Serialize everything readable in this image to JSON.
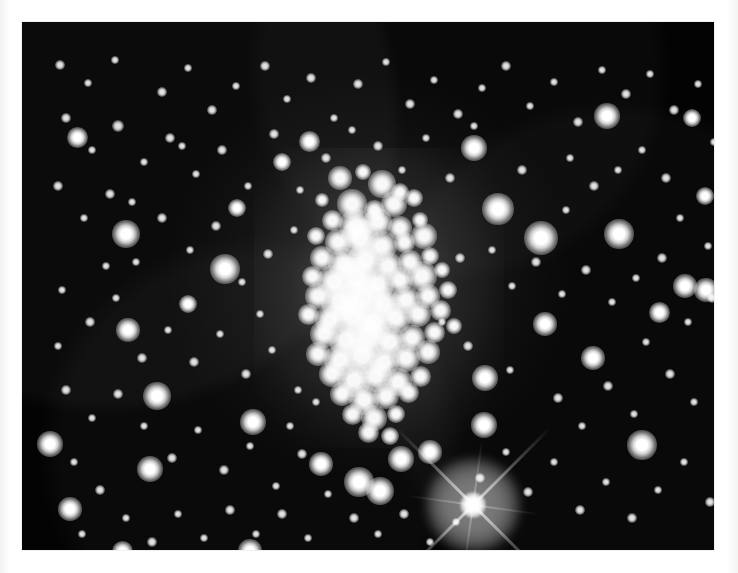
{
  "document": {
    "kind": "astronomical-photographic-plate",
    "subject": "dense star cluster field",
    "background_color": "#ffffff",
    "sky_color": "#030303",
    "star_color": "#ffffff"
  },
  "plate": {
    "x": 22,
    "y": 22,
    "width": 692,
    "height": 528,
    "label": "star-field-plate"
  },
  "cluster": {
    "name": "central star cluster core",
    "center_x": 357,
    "center_y": 276,
    "halo_width": 250,
    "halo_height": 300
  },
  "bright_spike_star": {
    "name": "bright foreground star with diffraction spikes",
    "x": 451,
    "y": 483,
    "core_size": 26,
    "spike_length": 118
  },
  "chart_data": {
    "type": "scatter",
    "title": "",
    "xlabel": "",
    "ylabel": "",
    "xlim": [
      0,
      692
    ],
    "ylim": [
      0,
      528
    ],
    "grid": false,
    "legend": null,
    "series": [
      {
        "name": "cluster-core-stars",
        "points": [
          [
            318,
            156,
            11
          ],
          [
            341,
            150,
            8
          ],
          [
            360,
            162,
            13
          ],
          [
            378,
            170,
            9
          ],
          [
            300,
            178,
            7
          ],
          [
            330,
            182,
            14
          ],
          [
            352,
            188,
            10
          ],
          [
            372,
            182,
            12
          ],
          [
            392,
            176,
            9
          ],
          [
            310,
            198,
            10
          ],
          [
            334,
            204,
            16
          ],
          [
            356,
            200,
            13
          ],
          [
            378,
            206,
            11
          ],
          [
            398,
            198,
            8
          ],
          [
            294,
            214,
            9
          ],
          [
            316,
            220,
            12
          ],
          [
            338,
            216,
            18
          ],
          [
            360,
            224,
            14
          ],
          [
            382,
            220,
            10
          ],
          [
            402,
            214,
            12
          ],
          [
            300,
            236,
            11
          ],
          [
            322,
            242,
            15
          ],
          [
            344,
            238,
            17
          ],
          [
            366,
            244,
            13
          ],
          [
            388,
            240,
            11
          ],
          [
            408,
            234,
            9
          ],
          [
            290,
            254,
            10
          ],
          [
            312,
            260,
            16
          ],
          [
            334,
            256,
            20
          ],
          [
            356,
            262,
            15
          ],
          [
            378,
            258,
            12
          ],
          [
            400,
            254,
            14
          ],
          [
            420,
            248,
            8
          ],
          [
            296,
            274,
            12
          ],
          [
            318,
            280,
            18
          ],
          [
            340,
            276,
            22
          ],
          [
            362,
            282,
            16
          ],
          [
            384,
            278,
            13
          ],
          [
            406,
            274,
            11
          ],
          [
            426,
            268,
            9
          ],
          [
            286,
            292,
            10
          ],
          [
            308,
            298,
            14
          ],
          [
            330,
            294,
            19
          ],
          [
            352,
            300,
            17
          ],
          [
            374,
            296,
            14
          ],
          [
            396,
            292,
            12
          ],
          [
            418,
            288,
            10
          ],
          [
            302,
            312,
            13
          ],
          [
            324,
            318,
            16
          ],
          [
            346,
            314,
            21
          ],
          [
            368,
            320,
            15
          ],
          [
            390,
            316,
            12
          ],
          [
            412,
            310,
            10
          ],
          [
            432,
            304,
            8
          ],
          [
            296,
            332,
            11
          ],
          [
            318,
            338,
            15
          ],
          [
            340,
            334,
            18
          ],
          [
            362,
            340,
            14
          ],
          [
            384,
            336,
            13
          ],
          [
            406,
            330,
            11
          ],
          [
            310,
            352,
            12
          ],
          [
            332,
            358,
            16
          ],
          [
            354,
            354,
            15
          ],
          [
            376,
            360,
            13
          ],
          [
            398,
            354,
            10
          ],
          [
            320,
            372,
            11
          ],
          [
            342,
            378,
            14
          ],
          [
            364,
            374,
            12
          ],
          [
            386,
            370,
            10
          ],
          [
            330,
            392,
            10
          ],
          [
            352,
            396,
            12
          ],
          [
            374,
            392,
            9
          ],
          [
            346,
            410,
            10
          ],
          [
            368,
            414,
            9
          ]
        ]
      },
      {
        "name": "bright-field-stars",
        "points": [
          [
            104,
            212,
            13
          ],
          [
            203,
            247,
            14
          ],
          [
            519,
            216,
            16
          ],
          [
            597,
            212,
            14
          ],
          [
            135,
            374,
            13
          ],
          [
            231,
            400,
            12
          ],
          [
            476,
            187,
            15
          ],
          [
            452,
            126,
            12
          ],
          [
            585,
            94,
            12
          ],
          [
            663,
            264,
            11
          ],
          [
            684,
            268,
            11
          ],
          [
            106,
            308,
            11
          ],
          [
            128,
            447,
            12
          ],
          [
            55,
            115,
            10
          ],
          [
            48,
            487,
            11
          ],
          [
            100,
            529,
            10
          ],
          [
            228,
            529,
            11
          ],
          [
            337,
            460,
            14
          ],
          [
            358,
            469,
            13
          ],
          [
            379,
            437,
            12
          ],
          [
            408,
            430,
            11
          ],
          [
            462,
            403,
            12
          ],
          [
            463,
            356,
            12
          ],
          [
            523,
            302,
            11
          ],
          [
            571,
            336,
            11
          ],
          [
            620,
            423,
            14
          ],
          [
            637,
            290,
            10
          ],
          [
            670,
            96,
            9
          ],
          [
            683,
            174,
            9
          ],
          [
            215,
            186,
            9
          ],
          [
            260,
            140,
            9
          ],
          [
            287,
            119,
            10
          ],
          [
            166,
            282,
            9
          ],
          [
            28,
            422,
            12
          ],
          [
            299,
            442,
            11
          ]
        ]
      },
      {
        "name": "faint-field-stars",
        "points": [
          [
            38,
            43,
            5
          ],
          [
            66,
            61,
            4
          ],
          [
            93,
            38,
            4
          ],
          [
            140,
            70,
            5
          ],
          [
            166,
            46,
            4
          ],
          [
            190,
            88,
            5
          ],
          [
            214,
            64,
            4
          ],
          [
            243,
            44,
            5
          ],
          [
            265,
            77,
            4
          ],
          [
            289,
            56,
            5
          ],
          [
            312,
            96,
            4
          ],
          [
            336,
            62,
            5
          ],
          [
            364,
            40,
            4
          ],
          [
            388,
            82,
            5
          ],
          [
            412,
            58,
            4
          ],
          [
            436,
            92,
            5
          ],
          [
            460,
            66,
            4
          ],
          [
            484,
            44,
            5
          ],
          [
            508,
            84,
            4
          ],
          [
            532,
            60,
            4
          ],
          [
            556,
            100,
            5
          ],
          [
            580,
            48,
            4
          ],
          [
            604,
            72,
            5
          ],
          [
            628,
            52,
            4
          ],
          [
            652,
            88,
            5
          ],
          [
            676,
            62,
            4
          ],
          [
            700,
            40,
            4
          ],
          [
            44,
            96,
            5
          ],
          [
            70,
            128,
            4
          ],
          [
            96,
            104,
            6
          ],
          [
            122,
            140,
            4
          ],
          [
            148,
            116,
            5
          ],
          [
            174,
            152,
            4
          ],
          [
            200,
            128,
            5
          ],
          [
            226,
            164,
            4
          ],
          [
            252,
            112,
            5
          ],
          [
            278,
            168,
            4
          ],
          [
            304,
            136,
            5
          ],
          [
            330,
            108,
            4
          ],
          [
            356,
            124,
            5
          ],
          [
            380,
            148,
            4
          ],
          [
            404,
            116,
            4
          ],
          [
            428,
            156,
            5
          ],
          [
            452,
            104,
            4
          ],
          [
            500,
            148,
            5
          ],
          [
            548,
            136,
            4
          ],
          [
            572,
            164,
            5
          ],
          [
            620,
            128,
            4
          ],
          [
            644,
            156,
            5
          ],
          [
            692,
            120,
            4
          ],
          [
            36,
            164,
            5
          ],
          [
            62,
            196,
            4
          ],
          [
            88,
            172,
            5
          ],
          [
            114,
            240,
            4
          ],
          [
            140,
            196,
            5
          ],
          [
            168,
            228,
            4
          ],
          [
            194,
            204,
            5
          ],
          [
            220,
            260,
            4
          ],
          [
            246,
            232,
            5
          ],
          [
            272,
            208,
            4
          ],
          [
            438,
            236,
            5
          ],
          [
            490,
            264,
            4
          ],
          [
            514,
            240,
            5
          ],
          [
            540,
            272,
            4
          ],
          [
            564,
            248,
            5
          ],
          [
            590,
            280,
            4
          ],
          [
            614,
            256,
            4
          ],
          [
            640,
            236,
            5
          ],
          [
            666,
            300,
            4
          ],
          [
            690,
            276,
            5
          ],
          [
            40,
            268,
            4
          ],
          [
            68,
            300,
            5
          ],
          [
            94,
            276,
            4
          ],
          [
            120,
            336,
            5
          ],
          [
            146,
            308,
            4
          ],
          [
            172,
            340,
            5
          ],
          [
            198,
            312,
            4
          ],
          [
            224,
            352,
            5
          ],
          [
            250,
            328,
            4
          ],
          [
            276,
            368,
            4
          ],
          [
            446,
            324,
            5
          ],
          [
            488,
            348,
            4
          ],
          [
            536,
            376,
            5
          ],
          [
            560,
            404,
            4
          ],
          [
            586,
            364,
            5
          ],
          [
            612,
            392,
            4
          ],
          [
            648,
            352,
            5
          ],
          [
            672,
            380,
            4
          ],
          [
            696,
            340,
            4
          ],
          [
            44,
            368,
            5
          ],
          [
            70,
            396,
            4
          ],
          [
            96,
            372,
            5
          ],
          [
            122,
            404,
            4
          ],
          [
            150,
            436,
            5
          ],
          [
            176,
            408,
            4
          ],
          [
            202,
            448,
            5
          ],
          [
            228,
            424,
            4
          ],
          [
            254,
            464,
            4
          ],
          [
            280,
            432,
            5
          ],
          [
            306,
            472,
            4
          ],
          [
            332,
            496,
            5
          ],
          [
            356,
            512,
            4
          ],
          [
            382,
            492,
            5
          ],
          [
            408,
            520,
            4
          ],
          [
            434,
            500,
            4
          ],
          [
            458,
            456,
            5
          ],
          [
            484,
            430,
            4
          ],
          [
            506,
            470,
            5
          ],
          [
            532,
            440,
            4
          ],
          [
            558,
            488,
            5
          ],
          [
            584,
            460,
            4
          ],
          [
            610,
            496,
            5
          ],
          [
            636,
            468,
            4
          ],
          [
            662,
            440,
            4
          ],
          [
            688,
            480,
            5
          ],
          [
            52,
            440,
            4
          ],
          [
            78,
            468,
            5
          ],
          [
            104,
            496,
            4
          ],
          [
            130,
            520,
            5
          ],
          [
            156,
            492,
            4
          ],
          [
            182,
            516,
            4
          ],
          [
            208,
            488,
            5
          ],
          [
            234,
            512,
            4
          ],
          [
            260,
            492,
            5
          ],
          [
            286,
            516,
            4
          ],
          [
            60,
            512,
            4
          ],
          [
            36,
            324,
            4
          ],
          [
            84,
            244,
            4
          ],
          [
            110,
            180,
            4
          ],
          [
            160,
            124,
            4
          ],
          [
            238,
            292,
            4
          ],
          [
            268,
            404,
            4
          ],
          [
            294,
            380,
            4
          ],
          [
            420,
            300,
            4
          ],
          [
            470,
            228,
            4
          ],
          [
            544,
            188,
            4
          ],
          [
            596,
            148,
            4
          ],
          [
            624,
            320,
            4
          ],
          [
            658,
            196,
            4
          ],
          [
            686,
            224,
            4
          ],
          [
            704,
            160,
            4
          ]
        ]
      }
    ]
  }
}
